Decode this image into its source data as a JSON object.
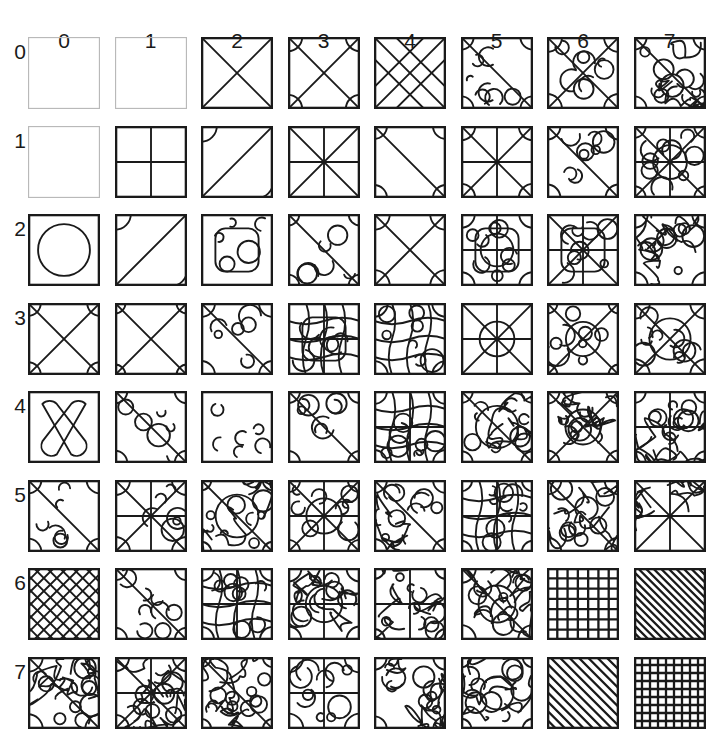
{
  "figure": {
    "type": "pattern-matrix",
    "rows": 8,
    "cols": 8,
    "background_color": "#ffffff",
    "stroke_color": "#1a1a1a",
    "faint_stroke_color": "#b9b9b9",
    "column_labels": [
      "0",
      "1",
      "2",
      "3",
      "4",
      "5",
      "6",
      "7"
    ],
    "row_labels": [
      "0",
      "1",
      "2",
      "3",
      "4",
      "5",
      "6",
      "7"
    ],
    "column_label_y": 30,
    "row_label_x": 20,
    "grid_origin_x": 28,
    "grid_origin_y": 37,
    "tile_size": 72,
    "col_step": 86.5,
    "row_step": 88.5
  },
  "chart_data": {
    "type": "heatmap",
    "title": "",
    "xlabel": "",
    "ylabel": "",
    "categories": [
      "0",
      "1",
      "2",
      "3",
      "4",
      "5",
      "6",
      "7"
    ],
    "row_categories": [
      "0",
      "1",
      "2",
      "3",
      "4",
      "5",
      "6",
      "7"
    ],
    "grid": "on",
    "legend": "none",
    "cells": [
      {
        "row": 0,
        "col": 0,
        "pattern": "empty",
        "density": 0,
        "faint": true
      },
      {
        "row": 0,
        "col": 1,
        "pattern": "empty",
        "density": 0,
        "faint": true
      },
      {
        "row": 0,
        "col": 2,
        "pattern": "diagonal-cross",
        "density": 2,
        "faint": false
      },
      {
        "row": 0,
        "col": 3,
        "pattern": "diagonal-cross-arcs",
        "density": 3,
        "faint": false
      },
      {
        "row": 0,
        "col": 4,
        "pattern": "double-diagonal-cross",
        "density": 4,
        "faint": false
      },
      {
        "row": 0,
        "col": 5,
        "pattern": "diagonal-blobs",
        "density": 5,
        "faint": false
      },
      {
        "row": 0,
        "col": 6,
        "pattern": "quad-cross-blobs",
        "density": 6,
        "faint": false
      },
      {
        "row": 0,
        "col": 7,
        "pattern": "wavy-maze",
        "density": 7,
        "faint": false
      },
      {
        "row": 1,
        "col": 0,
        "pattern": "empty",
        "density": 0,
        "faint": true
      },
      {
        "row": 1,
        "col": 1,
        "pattern": "plus-cross",
        "density": 1,
        "faint": false
      },
      {
        "row": 1,
        "col": 2,
        "pattern": "anti-diagonal-arcs",
        "density": 2,
        "faint": false
      },
      {
        "row": 1,
        "col": 3,
        "pattern": "star-eight",
        "density": 3,
        "faint": false
      },
      {
        "row": 1,
        "col": 4,
        "pattern": "diagonal-arcs-sweep",
        "density": 4,
        "faint": false
      },
      {
        "row": 1,
        "col": 5,
        "pattern": "star-quad-arcs",
        "density": 5,
        "faint": false
      },
      {
        "row": 1,
        "col": 6,
        "pattern": "diagonal-lobes",
        "density": 6,
        "faint": false
      },
      {
        "row": 1,
        "col": 7,
        "pattern": "cross-circle-lobes",
        "density": 7,
        "faint": false
      },
      {
        "row": 2,
        "col": 0,
        "pattern": "circle",
        "density": 1,
        "faint": false
      },
      {
        "row": 2,
        "col": 1,
        "pattern": "anti-diagonal-corner-arcs",
        "density": 2,
        "faint": false
      },
      {
        "row": 2,
        "col": 2,
        "pattern": "rounded-frame-bars",
        "density": 3,
        "faint": false
      },
      {
        "row": 2,
        "col": 3,
        "pattern": "diagonal-step-curves",
        "density": 4,
        "faint": false
      },
      {
        "row": 2,
        "col": 4,
        "pattern": "cross-arc-corners",
        "density": 5,
        "faint": false
      },
      {
        "row": 2,
        "col": 5,
        "pattern": "circle-in-frame-lobes",
        "density": 6,
        "faint": false
      },
      {
        "row": 2,
        "col": 6,
        "pattern": "rounded-cross-frame",
        "density": 6,
        "faint": false
      },
      {
        "row": 2,
        "col": 7,
        "pattern": "dense-blob-field",
        "density": 7,
        "faint": false
      },
      {
        "row": 3,
        "col": 0,
        "pattern": "cross-with-arcs",
        "density": 3,
        "faint": false
      },
      {
        "row": 3,
        "col": 1,
        "pattern": "plus-cross-quarter-arcs",
        "density": 3,
        "faint": false
      },
      {
        "row": 3,
        "col": 2,
        "pattern": "diagonal-rounded-steps",
        "density": 4,
        "faint": false
      },
      {
        "row": 3,
        "col": 3,
        "pattern": "grid-rounded-bars",
        "density": 5,
        "faint": false
      },
      {
        "row": 3,
        "col": 4,
        "pattern": "wave-columns",
        "density": 5,
        "faint": false
      },
      {
        "row": 3,
        "col": 5,
        "pattern": "star-eight-ring",
        "density": 6,
        "faint": false
      },
      {
        "row": 3,
        "col": 6,
        "pattern": "circle-blobs-cross",
        "density": 6,
        "faint": false
      },
      {
        "row": 3,
        "col": 7,
        "pattern": "ring-cross-lobes",
        "density": 7,
        "faint": false
      },
      {
        "row": 4,
        "col": 0,
        "pattern": "rounded-bowtie",
        "density": 2,
        "faint": false
      },
      {
        "row": 4,
        "col": 1,
        "pattern": "diagonal-arc-scatter",
        "density": 4,
        "faint": false
      },
      {
        "row": 4,
        "col": 2,
        "pattern": "rounded-square-center",
        "density": 4,
        "faint": false
      },
      {
        "row": 4,
        "col": 3,
        "pattern": "diagonal-wave-bands",
        "density": 5,
        "faint": false
      },
      {
        "row": 4,
        "col": 4,
        "pattern": "fine-grid-waves",
        "density": 6,
        "faint": false
      },
      {
        "row": 4,
        "col": 5,
        "pattern": "diagonal-contours",
        "density": 6,
        "faint": false
      },
      {
        "row": 4,
        "col": 6,
        "pattern": "cross-contour-mix",
        "density": 7,
        "faint": false
      },
      {
        "row": 4,
        "col": 7,
        "pattern": "dense-cell-field",
        "density": 8,
        "faint": false
      },
      {
        "row": 5,
        "col": 0,
        "pattern": "diagonal-corner-blobs",
        "density": 4,
        "faint": false
      },
      {
        "row": 5,
        "col": 1,
        "pattern": "plus-cross-blobs",
        "density": 4,
        "faint": false
      },
      {
        "row": 5,
        "col": 2,
        "pattern": "diagonal-contour-rings",
        "density": 6,
        "faint": false
      },
      {
        "row": 5,
        "col": 3,
        "pattern": "circle-cross-rosette",
        "density": 6,
        "faint": false
      },
      {
        "row": 5,
        "col": 4,
        "pattern": "diagonal-bracket-field",
        "density": 6,
        "faint": false
      },
      {
        "row": 5,
        "col": 5,
        "pattern": "rounded-grid-cells",
        "density": 7,
        "faint": false
      },
      {
        "row": 5,
        "col": 6,
        "pattern": "zigzag-diagonal-field",
        "density": 7,
        "faint": false
      },
      {
        "row": 5,
        "col": 7,
        "pattern": "cross-star-dense",
        "density": 8,
        "faint": false
      },
      {
        "row": 6,
        "col": 0,
        "pattern": "diagonal-lattice",
        "density": 6,
        "faint": false
      },
      {
        "row": 6,
        "col": 1,
        "pattern": "diagonal-rounded-blobs",
        "density": 6,
        "faint": false
      },
      {
        "row": 6,
        "col": 2,
        "pattern": "grid-rounded-cells",
        "density": 7,
        "faint": false
      },
      {
        "row": 6,
        "col": 3,
        "pattern": "circle-contour-plus",
        "density": 7,
        "faint": false
      },
      {
        "row": 6,
        "col": 4,
        "pattern": "plus-blob-field",
        "density": 7,
        "faint": false
      },
      {
        "row": 6,
        "col": 5,
        "pattern": "diagonal-contour-stripes",
        "density": 8,
        "faint": false
      },
      {
        "row": 6,
        "col": 6,
        "pattern": "fine-grid",
        "density": 9,
        "faint": false
      },
      {
        "row": 6,
        "col": 7,
        "pattern": "diagonal-hatch",
        "density": 9,
        "faint": false
      },
      {
        "row": 7,
        "col": 0,
        "pattern": "wavy-diagonal-maze",
        "density": 8,
        "faint": false
      },
      {
        "row": 7,
        "col": 1,
        "pattern": "plus-cross-curl-field",
        "density": 8,
        "faint": false
      },
      {
        "row": 7,
        "col": 2,
        "pattern": "diagonal-blob-maze",
        "density": 8,
        "faint": false
      },
      {
        "row": 7,
        "col": 3,
        "pattern": "quad-blob-cells",
        "density": 8,
        "faint": false
      },
      {
        "row": 7,
        "col": 4,
        "pattern": "hex-blob-field",
        "density": 8,
        "faint": false
      },
      {
        "row": 7,
        "col": 5,
        "pattern": "circle-contour-field",
        "density": 8,
        "faint": false
      },
      {
        "row": 7,
        "col": 6,
        "pattern": "diagonal-hatch-wide",
        "density": 9,
        "faint": false
      },
      {
        "row": 7,
        "col": 7,
        "pattern": "fine-grid-dense",
        "density": 9,
        "faint": false
      }
    ]
  }
}
